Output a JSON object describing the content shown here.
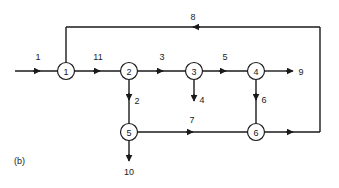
{
  "figure": {
    "caption": "(b)",
    "type": "signal-flow-graph",
    "background_color": "#ffffff",
    "ink_color": "#1a1a1a"
  },
  "nodes": [
    {
      "id": "n1",
      "label": "1",
      "cx": 66,
      "cy": 71,
      "r": 8.5
    },
    {
      "id": "n2",
      "label": "2",
      "cx": 129,
      "cy": 71,
      "r": 8.5
    },
    {
      "id": "n3",
      "label": "3",
      "cx": 194,
      "cy": 71,
      "r": 8.5
    },
    {
      "id": "n4",
      "label": "4",
      "cx": 256,
      "cy": 71,
      "r": 8.5
    },
    {
      "id": "n5",
      "label": "5",
      "cx": 129,
      "cy": 132,
      "r": 8.5
    },
    {
      "id": "n6",
      "label": "6",
      "cx": 256,
      "cy": 132,
      "r": 8.5
    }
  ],
  "edges": [
    {
      "id": "e1",
      "label": "1",
      "from": "input",
      "to": "n1",
      "label_x": 38,
      "label_y": 57
    },
    {
      "id": "e11",
      "label": "11",
      "from": "n1",
      "to": "n2",
      "label_x": 98,
      "label_y": 57
    },
    {
      "id": "e3",
      "label": "3",
      "from": "n2",
      "to": "n3",
      "label_x": 162,
      "label_y": 57
    },
    {
      "id": "e5",
      "label": "5",
      "from": "n3",
      "to": "n4",
      "label_x": 225,
      "label_y": 57
    },
    {
      "id": "e9",
      "label": "9",
      "from": "n4",
      "to": "output",
      "label_x": 301,
      "label_y": 72
    },
    {
      "id": "e2",
      "label": "2",
      "from": "n2",
      "to": "n5",
      "label_x": 137,
      "label_y": 101
    },
    {
      "id": "e4",
      "label": "4",
      "from": "n3",
      "to": "output",
      "label_x": 202,
      "label_y": 100
    },
    {
      "id": "e6",
      "label": "6",
      "from": "n4",
      "to": "n6",
      "label_x": 264,
      "label_y": 100
    },
    {
      "id": "e7",
      "label": "7",
      "from": "n5",
      "to": "n6",
      "label_x": 192,
      "label_y": 120
    },
    {
      "id": "e10",
      "label": "10",
      "from": "n5",
      "to": "output",
      "label_x": 129,
      "label_y": 172
    },
    {
      "id": "e8",
      "label": "8",
      "from": "n6",
      "to": "n1",
      "label_x": 193,
      "label_y": 17
    }
  ]
}
